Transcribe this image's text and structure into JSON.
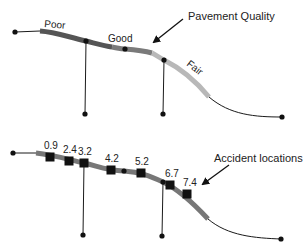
{
  "top_panel": {
    "callout": "Pavement Quality",
    "quality_labels": [
      {
        "label": "Poor",
        "shade": "#555555"
      },
      {
        "label": "Good",
        "shade": "#7a7a7a"
      },
      {
        "label": "Fair",
        "shade": "#b8b8b8"
      }
    ]
  },
  "bottom_panel": {
    "callout": "Accident locations",
    "accidents": [
      {
        "label": "0.9"
      },
      {
        "label": "2.4"
      },
      {
        "label": "3.2"
      },
      {
        "label": "4.2"
      },
      {
        "label": "5.2"
      },
      {
        "label": "6.7"
      },
      {
        "label": "7.4"
      }
    ]
  },
  "colors": {
    "road_line": "#1a1a1a",
    "node": "#111111",
    "poor_segment": "#555555",
    "good_segment": "#7a7a7a",
    "fair_segment": "#b8b8b8",
    "accident_segment": "#777777",
    "accident_marker": "#111111"
  }
}
